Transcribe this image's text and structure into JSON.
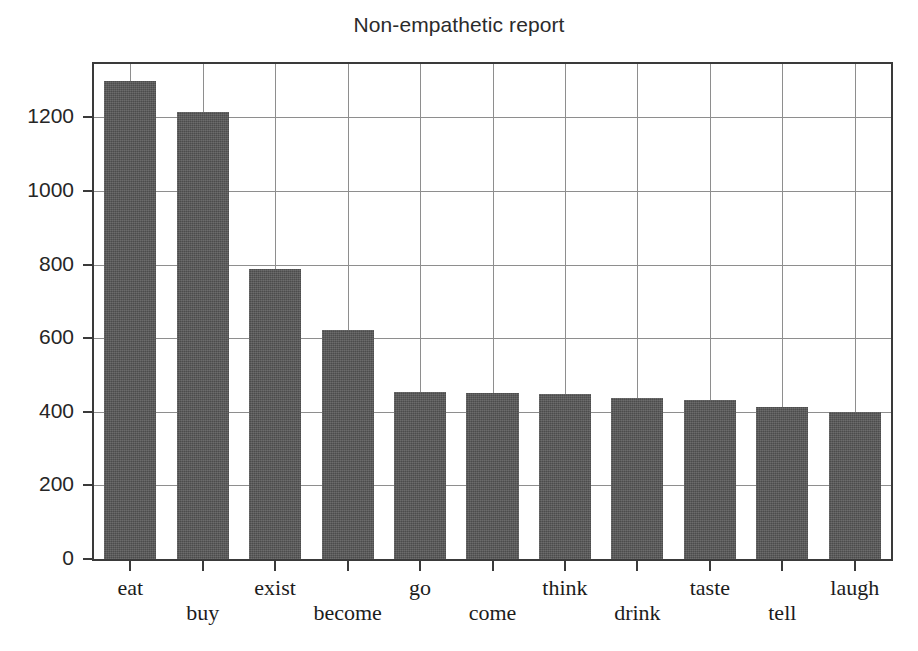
{
  "chart_data": {
    "type": "bar",
    "title": "Non-empathetic report",
    "xlabel": "",
    "ylabel": "",
    "categories": [
      "eat",
      "buy",
      "exist",
      "become",
      "go",
      "come",
      "think",
      "drink",
      "taste",
      "tell",
      "laugh"
    ],
    "values": [
      1300,
      1215,
      787,
      622,
      455,
      450,
      448,
      437,
      432,
      412,
      400
    ],
    "ylim": [
      0,
      1345
    ],
    "yticks": [
      0,
      200,
      400,
      600,
      800,
      1000,
      1200
    ],
    "ytick_labels": [
      "0",
      "200",
      "400",
      "600",
      "800",
      "1000",
      "1200"
    ],
    "grid": true,
    "legend": null,
    "bar_color": "#575757",
    "grid_color": "#8e8e8e",
    "axes_color": "#3a3a3a",
    "background_color": "#ffffff"
  }
}
